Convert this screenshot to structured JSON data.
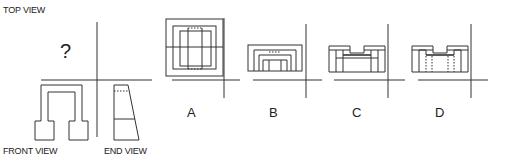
{
  "labels": {
    "top_view": "TOP VIEW",
    "front_view": "FRONT VIEW",
    "end_view": "END VIEW",
    "unknown": "?"
  },
  "options": [
    {
      "id": "A",
      "label": "A"
    },
    {
      "id": "B",
      "label": "B"
    },
    {
      "id": "C",
      "label": "C"
    },
    {
      "id": "D",
      "label": "D"
    }
  ],
  "colors": {
    "line": "#333333",
    "background": "#ffffff"
  }
}
